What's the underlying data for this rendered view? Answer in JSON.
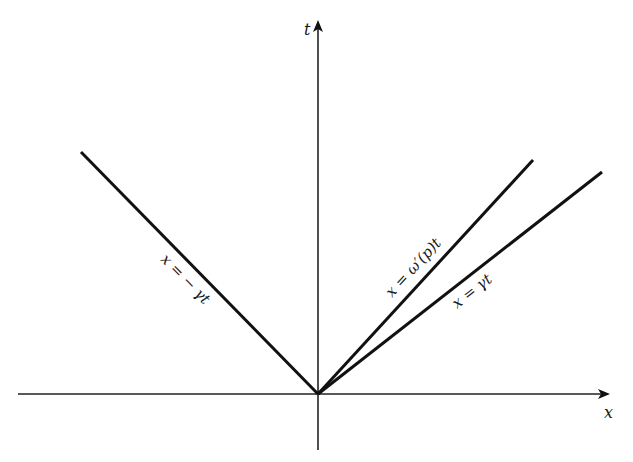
{
  "diagram": {
    "axes": {
      "x_label": "x",
      "t_label": "t"
    },
    "lines": [
      {
        "id": "left",
        "label": "x = − γt"
      },
      {
        "id": "group",
        "label": "x = ω′(p)t"
      },
      {
        "id": "right",
        "label": "x = γt"
      }
    ]
  }
}
